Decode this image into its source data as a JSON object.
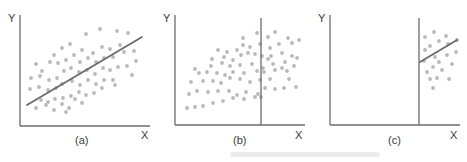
{
  "figure": {
    "point_color": "#b9b9b9",
    "line_color": "#6a6a6a",
    "axis_color": "#6b6b6b",
    "panels": [
      {
        "id": "a",
        "caption": "(a)",
        "y_label": "Y",
        "x_label": "X",
        "origin": [
          20,
          126
        ],
        "y_top": 15,
        "x_right": 150,
        "caption_pos": [
          75,
          144
        ],
        "y_label_pos": [
          8,
          22
        ],
        "x_label_pos": [
          141,
          139
        ],
        "cutoff_line": null,
        "fit_line": [
          [
            27,
            105
          ],
          [
            142,
            37
          ]
        ],
        "points": [
          [
            86,
            34
          ],
          [
            100,
            29
          ],
          [
            117,
            31
          ],
          [
            128,
            33
          ],
          [
            54,
            55
          ],
          [
            62,
            48
          ],
          [
            70,
            44
          ],
          [
            82,
            50
          ],
          [
            93,
            53
          ],
          [
            102,
            47
          ],
          [
            110,
            49
          ],
          [
            120,
            45
          ],
          [
            36,
            64
          ],
          [
            42,
            71
          ],
          [
            50,
            62
          ],
          [
            58,
            63
          ],
          [
            66,
            60
          ],
          [
            74,
            55
          ],
          [
            80,
            62
          ],
          [
            88,
            58
          ],
          [
            96,
            62
          ],
          [
            104,
            58
          ],
          [
            113,
            57
          ],
          [
            124,
            52
          ],
          [
            134,
            51
          ],
          [
            31,
            78
          ],
          [
            40,
            76
          ],
          [
            49,
            80
          ],
          [
            57,
            78
          ],
          [
            64,
            71
          ],
          [
            71,
            68
          ],
          [
            79,
            72
          ],
          [
            87,
            70
          ],
          [
            95,
            74
          ],
          [
            103,
            68
          ],
          [
            110,
            70
          ],
          [
            118,
            67
          ],
          [
            127,
            66
          ],
          [
            136,
            61
          ],
          [
            30,
            89
          ],
          [
            39,
            87
          ],
          [
            48,
            90
          ],
          [
            56,
            88
          ],
          [
            62,
            84
          ],
          [
            72,
            81
          ],
          [
            80,
            85
          ],
          [
            88,
            80
          ],
          [
            96,
            84
          ],
          [
            104,
            80
          ],
          [
            115,
            85
          ],
          [
            132,
            75
          ],
          [
            41,
            100
          ],
          [
            48,
            102
          ],
          [
            55,
            99
          ],
          [
            63,
            98
          ],
          [
            71,
            96
          ],
          [
            79,
            92
          ],
          [
            86,
            95
          ],
          [
            94,
            93
          ],
          [
            102,
            88
          ],
          [
            113,
            80
          ],
          [
            36,
            108
          ],
          [
            46,
            105
          ],
          [
            54,
            110
          ],
          [
            62,
            104
          ],
          [
            69,
            108
          ],
          [
            75,
            99
          ],
          [
            82,
            103
          ],
          [
            66,
            112
          ]
        ]
      },
      {
        "id": "b",
        "caption": "(b)",
        "y_label": "Y",
        "x_label": "X",
        "origin": [
          175,
          125
        ],
        "y_top": 15,
        "x_right": 305,
        "caption_pos": [
          233,
          144
        ],
        "y_label_pos": [
          163,
          22
        ],
        "x_label_pos": [
          295,
          139
        ],
        "cutoff_line": {
          "x": 261,
          "y_top": 18,
          "y_bottom": 125
        },
        "fit_line": null,
        "points": [
          [
            243,
            38
          ],
          [
            257,
            33
          ],
          [
            268,
            37
          ],
          [
            275,
            32
          ],
          [
            288,
            38
          ],
          [
            299,
            40
          ],
          [
            243,
            45
          ],
          [
            250,
            47
          ],
          [
            260,
            44
          ],
          [
            270,
            48
          ],
          [
            279,
            44
          ],
          [
            292,
            43
          ],
          [
            218,
            50
          ],
          [
            227,
            52
          ],
          [
            237,
            50
          ],
          [
            248,
            53
          ],
          [
            262,
            56
          ],
          [
            271,
            56
          ],
          [
            282,
            53
          ],
          [
            292,
            56
          ],
          [
            212,
            59
          ],
          [
            224,
            57
          ],
          [
            233,
            60
          ],
          [
            241,
            55
          ],
          [
            255,
            54
          ],
          [
            268,
            59
          ],
          [
            285,
            62
          ],
          [
            297,
            58
          ],
          [
            195,
            69
          ],
          [
            211,
            66
          ],
          [
            222,
            63
          ],
          [
            230,
            66
          ],
          [
            240,
            65
          ],
          [
            252,
            64
          ],
          [
            263,
            68
          ],
          [
            273,
            64
          ],
          [
            282,
            68
          ],
          [
            294,
            66
          ],
          [
            199,
            73
          ],
          [
            207,
            72
          ],
          [
            217,
            73
          ],
          [
            225,
            75
          ],
          [
            233,
            72
          ],
          [
            244,
            73
          ],
          [
            257,
            71
          ],
          [
            264,
            72
          ],
          [
            275,
            70
          ],
          [
            287,
            71
          ],
          [
            191,
            82
          ],
          [
            203,
            81
          ],
          [
            213,
            81
          ],
          [
            221,
            83
          ],
          [
            230,
            78
          ],
          [
            240,
            79
          ],
          [
            250,
            82
          ],
          [
            260,
            80
          ],
          [
            270,
            79
          ],
          [
            289,
            79
          ],
          [
            189,
            94
          ],
          [
            197,
            91
          ],
          [
            208,
            92
          ],
          [
            218,
            91
          ],
          [
            229,
            91
          ],
          [
            237,
            95
          ],
          [
            246,
            92
          ],
          [
            258,
            94
          ],
          [
            265,
            88
          ],
          [
            275,
            89
          ],
          [
            284,
            88
          ],
          [
            296,
            87
          ],
          [
            187,
            108
          ],
          [
            195,
            107
          ],
          [
            203,
            106
          ],
          [
            213,
            103
          ],
          [
            223,
            101
          ],
          [
            233,
            98
          ],
          [
            244,
            99
          ],
          [
            255,
            97
          ],
          [
            261,
            97
          ],
          [
            175,
            0
          ]
        ]
      },
      {
        "id": "c",
        "caption": "(c)",
        "y_label": "Y",
        "x_label": "X",
        "origin": [
          330,
          125
        ],
        "y_top": 15,
        "x_right": 460,
        "caption_pos": [
          388,
          144
        ],
        "y_label_pos": [
          318,
          22
        ],
        "x_label_pos": [
          450,
          139
        ],
        "cutoff_line": {
          "x": 419,
          "y_top": 18,
          "y_bottom": 125
        },
        "fit_line": [
          [
            420,
            62
          ],
          [
            457,
            40
          ]
        ],
        "points": [
          [
            425,
            37
          ],
          [
            434,
            32
          ],
          [
            446,
            36
          ],
          [
            457,
            40
          ],
          [
            425,
            50
          ],
          [
            430,
            46
          ],
          [
            439,
            41
          ],
          [
            448,
            44
          ],
          [
            424,
            61
          ],
          [
            435,
            57
          ],
          [
            447,
            55
          ],
          [
            456,
            52
          ],
          [
            427,
            72
          ],
          [
            433,
            67
          ],
          [
            439,
            62
          ],
          [
            442,
            70
          ],
          [
            452,
            64
          ],
          [
            430,
            79
          ],
          [
            437,
            78
          ],
          [
            449,
            79
          ],
          [
            433,
            88
          ]
        ]
      }
    ],
    "watermark": {
      "text": "",
      "pos": [
        225,
        156
      ]
    }
  }
}
